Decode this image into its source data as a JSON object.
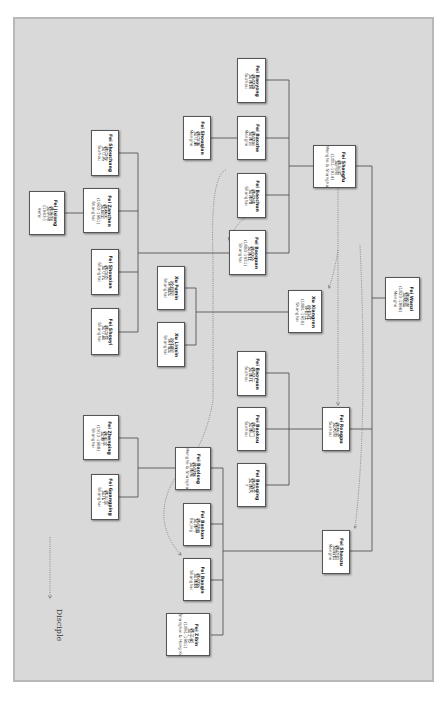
{
  "diagram": {
    "type": "family-tree",
    "orientation": "rotated-90-clockwise",
    "background_color": "#d9d9d9",
    "legend": {
      "label": "Disciple",
      "line_style": "dotted-arrow"
    }
  },
  "people": [
    {
      "id": "baoyong",
      "name": "Fei Baoyong",
      "chinese": "费保镛",
      "years": "",
      "place": "Suzhou",
      "box": [
        237,
        58,
        29,
        45
      ]
    },
    {
      "id": "shouqian",
      "name": "Fei Shouqian",
      "chinese": "费守谦",
      "years": "",
      "place": "Menghe",
      "box": [
        183,
        116,
        28,
        44
      ]
    },
    {
      "id": "baozhe",
      "name": "Fei Baozhe",
      "chinese": "费保哲",
      "years": "",
      "place": "Menghe",
      "box": [
        237,
        116,
        29,
        44
      ]
    },
    {
      "id": "baochun",
      "name": "Fei Baochun",
      "chinese": "费保纯",
      "years": "",
      "place": "Shanghai",
      "box": [
        237,
        173,
        29,
        45
      ]
    },
    {
      "id": "shangfu",
      "name": "Fei Shangfu",
      "chinese": "费尚甫",
      "years": "(1851-1914)",
      "place": "Menghe & Shanghai",
      "box": [
        313,
        145,
        43,
        43
      ]
    },
    {
      "id": "shouchang",
      "name": "Fei Shouchang",
      "chinese": "费守常",
      "years": "",
      "place": "Suzhou",
      "box": [
        91,
        130,
        28,
        46
      ]
    },
    {
      "id": "zanchen",
      "name": "Fei Zanchen",
      "chinese": "费赞臣",
      "years": "(1903-1981)",
      "place": "Shanghai",
      "box": [
        83,
        188,
        36,
        45
      ]
    },
    {
      "id": "jixiang",
      "name": "Fei Jixiang",
      "chinese": "费季翔",
      "years": "(1943-)",
      "place": "Hefei",
      "box": [
        29,
        191,
        36,
        44
      ]
    },
    {
      "id": "baoquan",
      "name": "Fei Baoquan",
      "chinese": "费保铨",
      "years": "(1883-1931)",
      "place": "Shanghai",
      "box": [
        229,
        230,
        37,
        45
      ]
    },
    {
      "id": "shouxian",
      "name": "Fei Shouxian",
      "chinese": "费守宪",
      "years": "",
      "place": "Shanghai",
      "box": [
        91,
        249,
        28,
        46
      ]
    },
    {
      "id": "shouyi",
      "name": "Fei Shouyi",
      "chinese": "费守意",
      "years": "",
      "place": "Shanghai",
      "box": [
        91,
        308,
        28,
        47
      ]
    },
    {
      "id": "fumin",
      "name": "Xu Fumin",
      "chinese": "徐福民",
      "years": "",
      "place": "Shanghai",
      "box": [
        157,
        266,
        28,
        44
      ]
    },
    {
      "id": "linxin",
      "name": "Xu Linxin",
      "chinese": "徐利民",
      "years": "",
      "place": "Shanghai",
      "box": [
        157,
        322,
        28,
        45
      ]
    },
    {
      "id": "xiangren",
      "name": "Xu Xiangren",
      "chinese": "徐相任",
      "years": "(1881-1959)",
      "place": "Shanghai",
      "box": [
        288,
        290,
        34,
        43
      ]
    },
    {
      "id": "wanzi",
      "name": "Fei Wanzi",
      "chinese": "费畹滋",
      "years": "(1823-1896)",
      "place": "Menghe",
      "box": [
        385,
        277,
        35,
        43
      ]
    },
    {
      "id": "baoyuan",
      "name": "Fei Baoyuan",
      "chinese": "费保元",
      "years": "",
      "place": "Suzhou",
      "box": [
        237,
        351,
        29,
        45
      ]
    },
    {
      "id": "baokou",
      "name": "Fei Baokou",
      "chinese": "费保口",
      "years": "",
      "place": "Suzhou",
      "box": [
        237,
        407,
        29,
        44
      ]
    },
    {
      "id": "rongpu",
      "name": "Fei Rongpu",
      "chinese": "费荣甫",
      "years": "",
      "place": "Suzhou",
      "box": [
        322,
        407,
        28,
        44
      ]
    },
    {
      "id": "zhenping",
      "name": "Fei Zhenping",
      "chinese": "费振平",
      "years": "(1913-1988)",
      "place": "Shanghai",
      "box": [
        83,
        415,
        36,
        45
      ]
    },
    {
      "id": "guangping",
      "name": "Fei Guangping",
      "chinese": "费光平",
      "years": "",
      "place": "Shanghai",
      "box": [
        91,
        474,
        28,
        46
      ]
    },
    {
      "id": "baolong",
      "name": "Fei Baolong",
      "chinese": "费保隆",
      "years": "",
      "place": "Menghe & Shanghai",
      "box": [
        175,
        447,
        36,
        43
      ]
    },
    {
      "id": "baoqing",
      "name": "Fei Baoqing",
      "chinese": "费保庆",
      "years": "",
      "place": "?",
      "box": [
        237,
        463,
        29,
        44
      ]
    },
    {
      "id": "baokun",
      "name": "Fei Baokun",
      "chinese": "费保坤",
      "years": "",
      "place": "Beijing",
      "box": [
        183,
        503,
        28,
        43
      ]
    },
    {
      "id": "baoqin",
      "name": "Fei Baoqin",
      "chinese": "费保勤",
      "years": "",
      "place": "Shanghai",
      "box": [
        183,
        558,
        28,
        43
      ]
    },
    {
      "id": "shaozu",
      "name": "Fei Shaozu",
      "chinese": "费绍祖",
      "years": "",
      "place": "Menghe",
      "box": [
        322,
        530,
        28,
        44
      ]
    },
    {
      "id": "zibin",
      "name": "Fei Zibin",
      "chinese": "费子彬",
      "years": "(1891-1981)",
      "place": "Shanghai & Hong Kong",
      "box": [
        166,
        613,
        44,
        43
      ]
    }
  ],
  "connectors": {
    "solid": [
      "M 420 298 L 372 298",
      "M 372 166 L 372 551",
      "M 372 166 L 356 166",
      "M 372 551 L 350 551",
      "M 372 429 L 350 429",
      "M 313 166 L 289 166",
      "M 289 80 L 289 253",
      "M 289 80 L 266 80",
      "M 289 138 L 266 138",
      "M 289 195 L 266 195",
      "M 289 253 L 266 253",
      "M 211 138 L 237 138",
      "M 229 253 L 138 253",
      "M 138 153 L 138 332",
      "M 138 153 L 119 153",
      "M 138 211 L 119 211",
      "M 138 272 L 119 272",
      "M 138 332 L 119 332",
      "M 65 213 L 83 213",
      "M 288 312 L 196 312",
      "M 196 288 L 196 345",
      "M 196 288 L 185 288",
      "M 196 345 L 185 345",
      "M 322 429 L 289 429",
      "M 289 373 L 289 485",
      "M 289 373 L 266 373",
      "M 289 429 L 266 429",
      "M 289 485 L 266 485",
      "M 322 551 L 223 551",
      "M 223 468 L 223 635",
      "M 223 468 L 211 468",
      "M 223 524 L 211 524",
      "M 223 580 L 211 580",
      "M 223 635 L 211 635",
      "M 175 468 L 138 468",
      "M 138 438 L 138 497",
      "M 138 438 L 119 438",
      "M 138 497 L 119 497"
    ],
    "dotted": [
      "M 338 188 L 338 405",
      "M 338 250 Q 335 270 329 288",
      "M 360 245 Q 368 420 355 528",
      "M 226 170 Q 210 175 213 260 L 213 400 Q 205 450 175 478 Q 150 520 181 555",
      "M 245 218 Q 235 225 229 240",
      "M 50 537 L 50 598"
    ]
  }
}
